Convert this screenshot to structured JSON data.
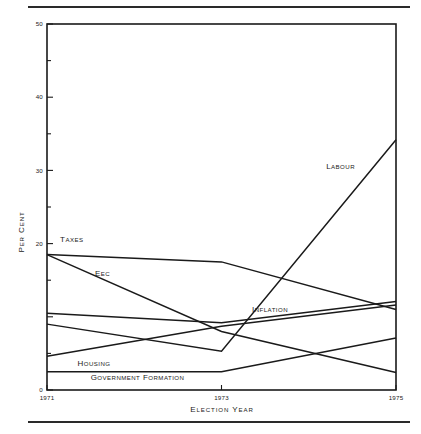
{
  "figure": {
    "has_top_rule": true,
    "has_bottom_rule": true,
    "ink_color": "#1a1a1a",
    "background": "#ffffff"
  },
  "chart_data": {
    "type": "line",
    "title": "",
    "xlabel": "Election Year",
    "ylabel": "Per Cent",
    "x": [
      1971,
      1973,
      1975
    ],
    "x_tick_labels": [
      "1971",
      "1973",
      "1975"
    ],
    "xlim": [
      1971,
      1975
    ],
    "ylim": [
      0,
      50
    ],
    "y_ticks": [
      0,
      10,
      20,
      30,
      40,
      50
    ],
    "y_tick_labels": [
      "0",
      "10",
      "20",
      "30",
      "40",
      "50"
    ],
    "y_labels_shown": [
      "0",
      "20",
      "30",
      "40",
      "50"
    ],
    "minor_y_ticks": [
      5,
      15,
      25,
      35,
      45
    ],
    "grid": false,
    "legend": "inline-labels",
    "series": [
      {
        "name": "Taxes",
        "label": "Taxes",
        "x": [
          1971,
          1973,
          1975
        ],
        "values": [
          18.5,
          17.5,
          11.0
        ],
        "label_x": 1971.15,
        "label_y": 20.2
      },
      {
        "name": "EEC",
        "label": "EEC",
        "x": [
          1971,
          1973,
          1975
        ],
        "values": [
          18.5,
          8.0,
          2.4
        ],
        "label_x": 1971.55,
        "label_y": 15.6
      },
      {
        "name": "Inflation",
        "label": "Inflation",
        "x": [
          1971,
          1973,
          1975
        ],
        "values": [
          10.5,
          9.2,
          12.1
        ],
        "label_x": 1973.35,
        "label_y": 10.6
      },
      {
        "name": "Labour",
        "label": "Labour",
        "x": [
          1971,
          1973,
          1975
        ],
        "values": [
          9.0,
          5.3,
          34.2
        ],
        "label_x": 1974.2,
        "label_y": 30.2
      },
      {
        "name": "Housing",
        "label": "Housing",
        "x": [
          1971,
          1973,
          1975
        ],
        "values": [
          4.6,
          8.7,
          11.6
        ],
        "label_x": 1971.35,
        "label_y": 3.3
      },
      {
        "name": "Government formation",
        "label": "Government formation",
        "x": [
          1971,
          1973,
          1975
        ],
        "values": [
          2.5,
          2.5,
          7.1
        ],
        "label_x": 1971.5,
        "label_y": 1.3
      }
    ]
  }
}
